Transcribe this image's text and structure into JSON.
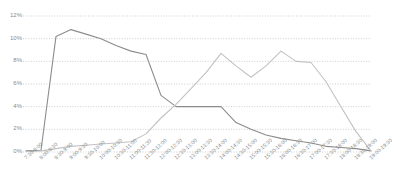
{
  "chart_data": {
    "type": "line",
    "title": "",
    "subtitle": "",
    "xlabel": "",
    "ylabel": "",
    "ylim": [
      0,
      12
    ],
    "ytick_labels": [
      "0%",
      "2%",
      "4%",
      "6%",
      "8%",
      "10%",
      "12%"
    ],
    "ytick_values": [
      0,
      2,
      4,
      6,
      8,
      10,
      12
    ],
    "grid": true,
    "grid_style": "dotted",
    "legend": "none",
    "legend_position": "none",
    "categories": [
      "7:30-8:00",
      "8:00-8:30",
      "8:30-9:00",
      "9:00-9:30",
      "9:30-10:00",
      "10:00-10:30",
      "10:30-11:00",
      "11:00-11:30",
      "11:30-12:00",
      "12:00-12:30",
      "12:30-13:00",
      "13:00-13:30",
      "13:30-14:00",
      "14:00-14:30",
      "14:30-15:00",
      "15:00-15:30",
      "15:30-16:00",
      "16:00-16:30",
      "16:30-17:00",
      "17:00-17:30",
      "17:30-18:00",
      "18:00-18:30",
      "18:30-19:00",
      "19:00-19:30"
    ],
    "series": [
      {
        "name": "series-dark",
        "color": "#8c8c8c",
        "values": [
          0.1,
          0.15,
          10.2,
          10.8,
          10.4,
          10.0,
          9.4,
          8.9,
          8.6,
          5.0,
          4.0,
          4.0,
          4.0,
          4.0,
          2.6,
          2.0,
          1.5,
          1.2,
          1.0,
          0.8,
          0.5,
          0.4,
          0.3,
          0.1
        ]
      },
      {
        "name": "series-light",
        "color": "#c2c2c2",
        "values": [
          0.05,
          0.1,
          0.3,
          0.5,
          0.6,
          0.7,
          0.8,
          0.9,
          1.6,
          3.0,
          4.2,
          5.6,
          7.0,
          8.7,
          7.6,
          6.6,
          7.6,
          8.9,
          8.0,
          7.9,
          6.2,
          4.0,
          1.8,
          0.1
        ]
      }
    ]
  },
  "axis": {
    "y_percent_suffix": "%"
  },
  "colors": {
    "grid": "#b9b9b9",
    "axis_text": "#8a8a8a",
    "series_dark": "#8c8c8c",
    "series_light": "#c2c2c2",
    "background": "#ffffff"
  }
}
